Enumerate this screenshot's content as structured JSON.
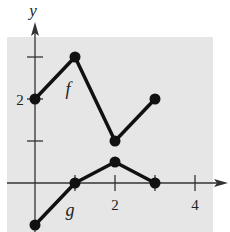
{
  "chart_data": {
    "type": "line",
    "title": "",
    "xlabel": "",
    "ylabel": "y",
    "xlim": [
      -0.7,
      4.7
    ],
    "ylim": [
      -1.1,
      3.7
    ],
    "grid": false,
    "background": "#e6e6e6",
    "x_ticks": [
      1,
      2,
      3,
      4
    ],
    "x_tick_labels": [
      {
        "value": 2,
        "label": "2"
      },
      {
        "value": 4,
        "label": "4"
      }
    ],
    "y_ticks": [
      1,
      2,
      3
    ],
    "y_tick_labels": [
      {
        "value": 2,
        "label": "2"
      }
    ],
    "series": [
      {
        "name": "f",
        "label": "f",
        "x": [
          0,
          1,
          2,
          3
        ],
        "y": [
          2,
          3,
          1,
          2
        ],
        "markers": true
      },
      {
        "name": "g",
        "label": "g",
        "x": [
          0,
          1,
          2,
          3
        ],
        "y": [
          -1,
          0,
          0.5,
          0
        ],
        "markers": true
      }
    ],
    "annotations": [
      {
        "text": "f",
        "x": 1.0,
        "y": 2.4
      },
      {
        "text": "g",
        "x": 0.85,
        "y": -0.7
      }
    ]
  },
  "labels": {
    "y_axis": "y",
    "x_tick_2": "2",
    "x_tick_4": "4",
    "y_tick_2": "2",
    "f_label": "f",
    "g_label": "g"
  }
}
